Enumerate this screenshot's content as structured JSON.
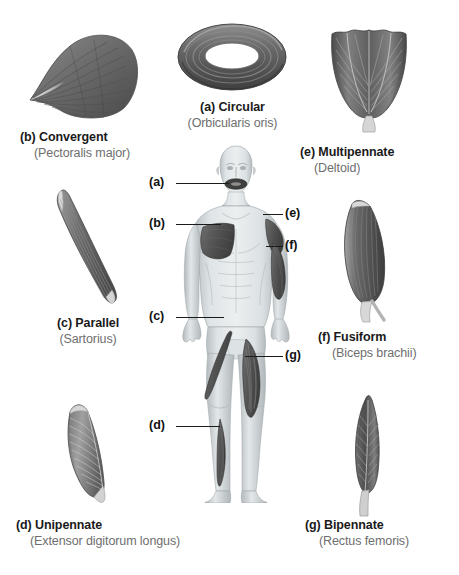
{
  "figure": {
    "background_color": "#ffffff",
    "text_color_primary": "#1a1a1a",
    "text_color_secondary": "#6e6e6e",
    "muscle_fill_dark": "#595959",
    "muscle_fill_mid": "#7a7a7a",
    "body_skin": "#cfd4d6"
  },
  "panels": [
    {
      "key": "b",
      "label": "(b) Convergent",
      "subtitle": "(Pectoralis major)",
      "icon": "convergent-muscle-shape"
    },
    {
      "key": "a",
      "label": "(a) Circular",
      "subtitle": "(Orbicularis oris)",
      "icon": "circular-muscle-shape"
    },
    {
      "key": "e",
      "label": "(e) Multipennate",
      "subtitle": "(Deltoid)",
      "icon": "multipennate-muscle-shape"
    },
    {
      "key": "c",
      "label": "(c) Parallel",
      "subtitle": "(Sartorius)",
      "icon": "parallel-muscle-shape"
    },
    {
      "key": "f",
      "label": "(f) Fusiform",
      "subtitle": "(Biceps brachii)",
      "icon": "fusiform-muscle-shape"
    },
    {
      "key": "d",
      "label": "(d) Unipennate",
      "subtitle": "(Extensor digitorum longus)",
      "icon": "unipennate-muscle-shape"
    },
    {
      "key": "g",
      "label": "(g) Bipennate",
      "subtitle": "(Rectus femoris)",
      "icon": "bipennate-muscle-shape"
    }
  ],
  "body_labels": [
    {
      "key": "a",
      "text": "(a)",
      "target": "orbicularis-oris"
    },
    {
      "key": "b",
      "text": "(b)",
      "target": "pectoralis-major"
    },
    {
      "key": "c",
      "text": "(c)",
      "target": "sartorius"
    },
    {
      "key": "d",
      "text": "(d)",
      "target": "extensor-digitorum-longus"
    },
    {
      "key": "e",
      "text": "(e)",
      "target": "deltoid"
    },
    {
      "key": "f",
      "text": "(f)",
      "target": "biceps-brachii"
    },
    {
      "key": "g",
      "text": "(g)",
      "target": "rectus-femoris"
    }
  ]
}
